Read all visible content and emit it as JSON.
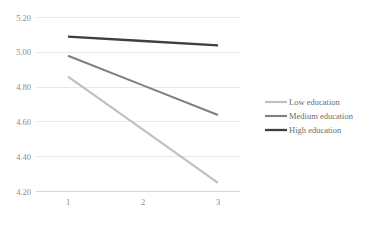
{
  "chart_data": {
    "type": "line",
    "title": "",
    "subtitle": "",
    "xlabel": "",
    "ylabel": "",
    "x": [
      1,
      2,
      3
    ],
    "categories": [
      "1",
      "2",
      "3"
    ],
    "xtick_labels": [
      "1",
      "2",
      "3"
    ],
    "ytick_labels": [
      "5.20",
      "5.00",
      "4.80",
      "4.60",
      "4.40",
      "4.20"
    ],
    "ytick_values": [
      5.2,
      5.0,
      4.8,
      4.6,
      4.4,
      4.2
    ],
    "ylim": [
      4.2,
      5.2
    ],
    "xlim": [
      1,
      3
    ],
    "grid": "horizontal",
    "legend_position": "right",
    "series": [
      {
        "name": "Low education",
        "color": "#bfbfbf",
        "values": [
          4.86,
          4.555,
          4.25
        ]
      },
      {
        "name": "Medium education",
        "color": "#808080",
        "values": [
          4.98,
          4.81,
          4.64
        ]
      },
      {
        "name": "High education",
        "color": "#3f3f3f",
        "values": [
          5.09,
          5.065,
          5.04
        ]
      }
    ]
  },
  "axis": {
    "y": {
      "t0": "5.20",
      "t1": "5.00",
      "t2": "4.80",
      "t3": "4.60",
      "t4": "4.40",
      "t5": "4.20"
    },
    "x": {
      "t0": "1",
      "t1": "2",
      "t2": "3"
    }
  },
  "legend": {
    "items": [
      {
        "label": "Low education",
        "color": "#bfbfbf"
      },
      {
        "label": "Medium education",
        "color": "#808080"
      },
      {
        "label": "High education",
        "color": "#3f3f3f"
      }
    ],
    "item0": "Low education",
    "item1": "Medium education",
    "item2": "High education"
  },
  "colors": {
    "grid": "#e8e8e8",
    "tick_text": "#8c8c8c",
    "legend_text": "#6d6d6d",
    "background": "#ffffff",
    "low": "#bfbfbf",
    "medium": "#808080",
    "high": "#3f3f3f"
  }
}
